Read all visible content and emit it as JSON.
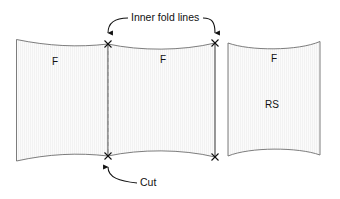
{
  "diagram": {
    "background_color": "#ffffff",
    "line_color": "#111111",
    "panel_stroke_color": "#6e6e6e",
    "panel_fill_color": "#fafafa",
    "callouts": [
      {
        "id": "inner-fold-lines",
        "text": "Inner fold lines",
        "x": 131,
        "y": 21,
        "points_to": [
          "left-inner-fold",
          "right-inner-fold"
        ]
      },
      {
        "id": "cut",
        "text": "Cut",
        "x": 140,
        "y": 186,
        "points_to": [
          "bottom-cut-point"
        ]
      }
    ],
    "panels": [
      {
        "id": "left-panel",
        "labels": [
          {
            "text": "F",
            "x": 55,
            "y": 65
          }
        ]
      },
      {
        "id": "middle-panel",
        "labels": [
          {
            "text": "F",
            "x": 163,
            "y": 63
          }
        ]
      },
      {
        "id": "right-panel",
        "labels": [
          {
            "text": "F",
            "x": 274,
            "y": 62
          },
          {
            "text": "RS",
            "x": 272,
            "y": 108
          }
        ]
      }
    ],
    "markers": [
      {
        "id": "left-inner-fold-top",
        "x": 108,
        "y": 44
      },
      {
        "id": "right-inner-fold-top",
        "x": 215,
        "y": 43
      },
      {
        "id": "left-inner-fold-bottom",
        "x": 108,
        "y": 156
      },
      {
        "id": "right-inner-fold-bottom",
        "x": 215,
        "y": 157
      }
    ]
  }
}
